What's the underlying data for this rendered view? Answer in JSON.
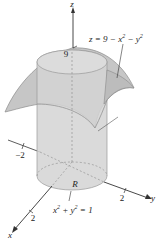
{
  "diagram": {
    "type": "3d-solid-region",
    "colors": {
      "surface_fill": "#c4c4c4",
      "surface_stroke": "#8a8a8a",
      "cylinder_fill": "#d3d3d3",
      "cylinder_stroke": "#9a9a9a",
      "axis": "#333333",
      "background": "#ffffff"
    },
    "labels": {
      "z_axis": "z",
      "y_axis": "y",
      "x_axis": "x",
      "z_intercept": "9",
      "neg_tick": "−2",
      "y_tick": "2",
      "x_tick": "2",
      "region": "R",
      "surface_eq_prefix": "z = 9 − x",
      "surface_eq_mid": " − y",
      "surface_eq_sup": "2",
      "cylinder_eq_x": "x",
      "cylinder_eq_plus": " + y",
      "cylinder_eq_end": " = 1",
      "cylinder_eq_sup": "2"
    }
  }
}
